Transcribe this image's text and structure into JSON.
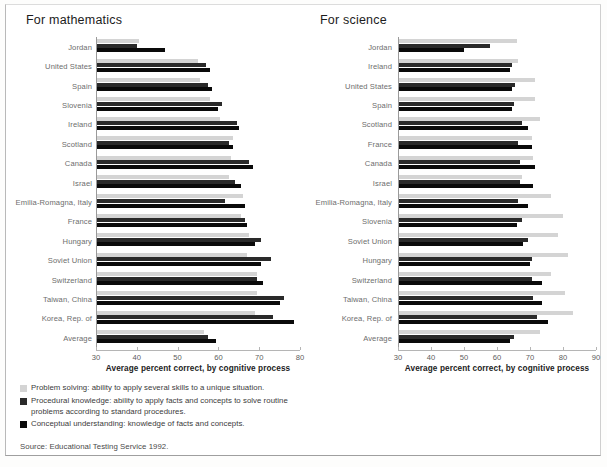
{
  "source_note": "Source: Educational Testing Service 1992.",
  "colors": {
    "series0": "#d4d4d4",
    "series1": "#2a2a2a",
    "series2": "#0a0a0a",
    "axis": "#b5b5b5",
    "label": "#6d6d6d"
  },
  "panels": [
    {
      "title": "For mathematics",
      "axis_title": "Average percent correct, by cognitive process",
      "legend": [
        "Problem solving: ability to apply several skills to a unique situation.",
        "Procedural knowledge: ability to apply facts and concepts to solve routine problems according to standard procedures.",
        "Conceptual understanding: knowledge of facts and concepts."
      ]
    },
    {
      "title": "For science",
      "axis_title": "Average percent correct, by cognitive process",
      "legend": [
        "Knows: knowledge of basic facts and concepts.",
        "Uses: ability to combine facts with rules for a specific purpose.",
        "Integrates: ability to draw conclusions from available data."
      ]
    }
  ],
  "chart_data": [
    {
      "type": "bar",
      "orientation": "horizontal",
      "title": "For mathematics",
      "xlabel": "Average percent correct, by cognitive process",
      "ylabel": "",
      "xlim": [
        30,
        80
      ],
      "xticks": [
        30,
        40,
        50,
        60,
        70,
        80
      ],
      "grid": false,
      "legend_position": "below",
      "categories": [
        "Jordan",
        "United States",
        "Spain",
        "Slovenia",
        "Ireland",
        "Scotland",
        "Canada",
        "Israel",
        "Emilia-Romagna, Italy",
        "France",
        "Hungary",
        "Soviet Union",
        "Switzerland",
        "Taiwan, China",
        "Korea, Rep. of",
        "Average"
      ],
      "series": [
        {
          "name": "Problem solving: ability to apply several skills to a unique situation.",
          "values": [
            40.5,
            55.0,
            55.5,
            58.0,
            60.5,
            63.5,
            63.0,
            62.5,
            66.0,
            65.5,
            67.5,
            67.0,
            69.5,
            69.5,
            69.0,
            56.5
          ]
        },
        {
          "name": "Procedural knowledge: ability to apply facts and concepts to solve routine problems according to standard procedures.",
          "values": [
            40.0,
            57.0,
            57.5,
            61.0,
            64.5,
            62.5,
            67.5,
            64.0,
            61.5,
            66.5,
            70.5,
            73.0,
            69.5,
            76.0,
            73.5,
            57.5
          ]
        },
        {
          "name": "Conceptual understanding: knowledge of facts and concepts.",
          "values": [
            47.0,
            58.0,
            58.5,
            60.0,
            65.0,
            63.5,
            68.5,
            65.5,
            66.5,
            67.0,
            69.0,
            70.5,
            71.0,
            75.0,
            78.5,
            59.5
          ]
        }
      ]
    },
    {
      "type": "bar",
      "orientation": "horizontal",
      "title": "For science",
      "xlabel": "Average percent correct, by cognitive process",
      "ylabel": "",
      "xlim": [
        30,
        90
      ],
      "xticks": [
        30,
        40,
        50,
        60,
        70,
        80,
        90
      ],
      "grid": false,
      "legend_position": "below",
      "categories": [
        "Jordan",
        "Ireland",
        "United States",
        "Spain",
        "Scotland",
        "France",
        "Canada",
        "Israel",
        "Emilia-Romagna, Italy",
        "Slovenia",
        "Soviet Union",
        "Hungary",
        "Switzerland",
        "Taiwan, China",
        "Korea, Rep. of",
        "Average"
      ],
      "series": [
        {
          "name": "Knows: knowledge of basic facts and concepts.",
          "values": [
            66.0,
            66.5,
            71.5,
            71.5,
            73.0,
            70.5,
            71.0,
            67.5,
            76.5,
            80.0,
            78.5,
            81.5,
            76.5,
            80.5,
            83.0,
            73.0
          ]
        },
        {
          "name": "Uses: ability to combine facts with rules for a specific purpose.",
          "values": [
            58.0,
            64.5,
            65.5,
            65.0,
            67.5,
            66.5,
            67.0,
            67.0,
            66.5,
            67.5,
            69.5,
            70.5,
            70.5,
            71.0,
            72.0,
            65.0
          ]
        },
        {
          "name": "Integrates: ability to draw conclusions from available data.",
          "values": [
            50.0,
            64.0,
            64.5,
            64.5,
            69.5,
            70.5,
            71.5,
            71.0,
            69.5,
            66.0,
            68.0,
            70.0,
            73.5,
            73.5,
            75.5,
            64.0
          ]
        }
      ]
    }
  ]
}
